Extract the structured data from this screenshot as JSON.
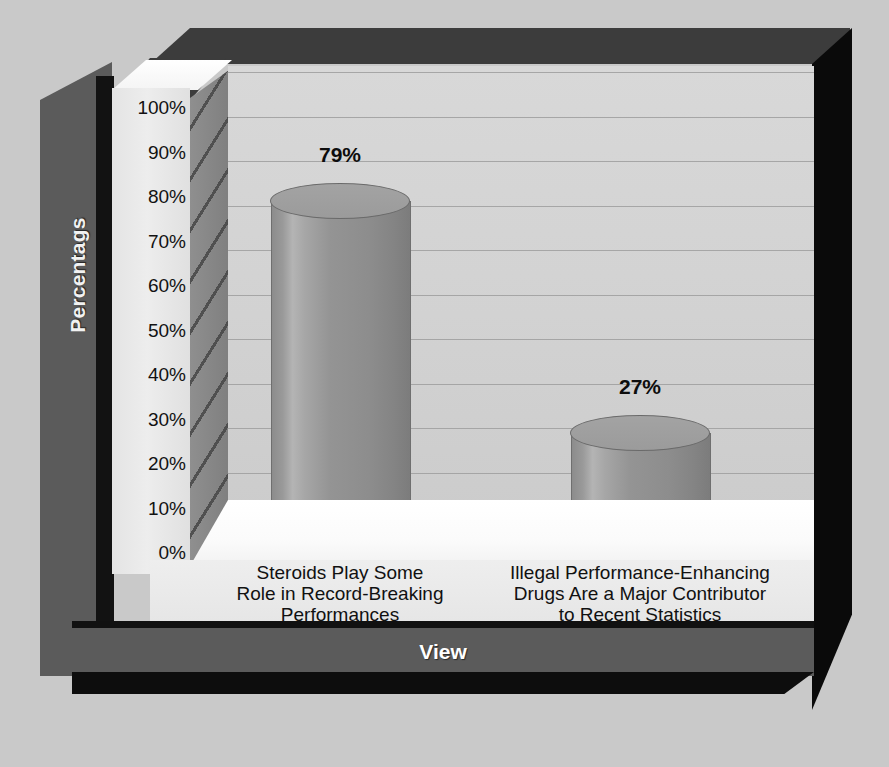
{
  "chart_data": {
    "type": "bar",
    "title": "",
    "subtitle": "",
    "xlabel": "View",
    "ylabel": "Percentags",
    "categories": [
      "Steroids Play Some Role in Record-Breaking Performances",
      "Illegal Performance-Enhancing Drugs Are a Major Contributor to Recent Statistics"
    ],
    "category_lines": [
      [
        "Steroids Play Some",
        "Role in Record-Breaking",
        "Performances"
      ],
      [
        "Illegal Performance-Enhancing",
        "Drugs Are a Major Contributor",
        "to Recent Statistics"
      ]
    ],
    "values": [
      79,
      27
    ],
    "data_labels": [
      "79%",
      "27%"
    ],
    "ylim": [
      0,
      100
    ],
    "ytick_values": [
      0,
      10,
      20,
      30,
      40,
      50,
      60,
      70,
      80,
      90,
      100
    ],
    "ytick_labels": [
      "0%",
      "10%",
      "20%",
      "30%",
      "40%",
      "50%",
      "60%",
      "70%",
      "80%",
      "90%",
      "100%"
    ],
    "grid": true,
    "legend": false,
    "style": "3d-cylinder",
    "colors": {
      "bar": "#949494",
      "plot_background": "#d4d4d4",
      "floor": "#fbfbfb",
      "frame_dark": "#3c3c3c",
      "frame_black": "#0d0d0d",
      "axis_band": "#5b5b5b",
      "page_background": "#c9c9c9",
      "gridline": "#9d9d9d",
      "label_text": "#111111",
      "title_text": "#ffffff"
    }
  }
}
